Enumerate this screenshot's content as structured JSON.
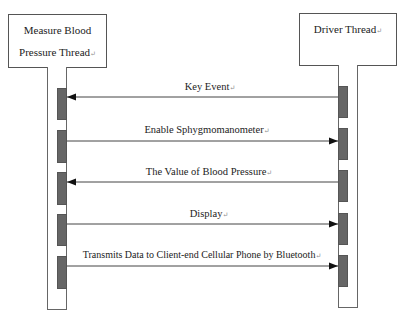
{
  "diagram": {
    "type": "sequence",
    "participants": [
      {
        "id": "left",
        "label_lines": [
          "Measure Blood",
          "Pressure Thread"
        ]
      },
      {
        "id": "right",
        "label_lines": [
          "Driver Thread"
        ]
      }
    ],
    "messages": [
      {
        "label": "Key Event",
        "from": "right",
        "to": "left"
      },
      {
        "label": "Enable Sphygmomanometer",
        "from": "left",
        "to": "right"
      },
      {
        "label": "The Value of Blood Pressure",
        "from": "right",
        "to": "left"
      },
      {
        "label": "Display",
        "from": "left",
        "to": "right"
      },
      {
        "label": "Transmits Data to Client-end Cellular Phone by Bluetooth",
        "from": "left",
        "to": "right"
      }
    ],
    "pilcrow": "↵",
    "colors": {
      "line": "#555555",
      "activation": "#666666",
      "background": "#ffffff"
    }
  }
}
